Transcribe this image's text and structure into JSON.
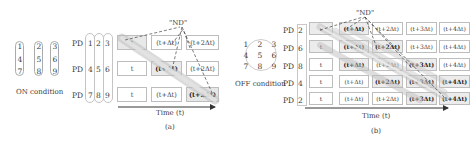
{
  "panel_a": {
    "caption": "(a)",
    "condition_label": "ON condition",
    "grid_numbers": [
      "1",
      "2",
      "3",
      "4",
      "5",
      "6",
      "7",
      "8",
      "9"
    ],
    "pd_label": "PD",
    "rows": [
      {
        "pd": "PD",
        "pixels": [
          "1",
          "2",
          "3"
        ],
        "cells": [
          "t",
          "(t+Δt)",
          "(t+2Δt)"
        ]
      },
      {
        "pd": "PD",
        "pixels": [
          "4",
          "5",
          "6"
        ],
        "cells": [
          "t",
          "(t+Δt)",
          "(t+2Δt)"
        ]
      },
      {
        "pd": "PD",
        "pixels": [
          "7",
          "8",
          "9"
        ],
        "cells": [
          "t",
          "(t+Δt)",
          "(t+2Δt)"
        ]
      }
    ],
    "nd_label": "\"ND\"",
    "axis_label": "Time (t)"
  },
  "panel_b": {
    "caption": "(b)",
    "condition_label": "OFF condition",
    "grid_numbers": [
      "1",
      "2",
      "3",
      "4",
      "5",
      "6",
      "7",
      "8",
      "9"
    ],
    "rows": [
      {
        "pd": "PD",
        "pixel": "2",
        "cells": [
          "t",
          "(t+Δt)",
          "(t+2Δt)",
          "(t+3Δt)",
          "(t+4Δt)"
        ]
      },
      {
        "pd": "PD",
        "pixel": "6",
        "cells": [
          "t",
          "(t+Δt)",
          "(t+2Δt)",
          "(t+3Δt)",
          "(t+4Δt)"
        ]
      },
      {
        "pd": "PD",
        "pixel": "8",
        "cells": [
          "t",
          "(t+Δt)",
          "(t+2Δt)",
          "(t+3Δt)",
          "(t+4Δt)"
        ]
      },
      {
        "pd": "PD",
        "pixel": "4",
        "cells": [
          "t",
          "(t+Δt)",
          "(t+2Δt)",
          "(t+3Δt)",
          "(t+4Δt)"
        ]
      },
      {
        "pd": "PD",
        "pixel": "2",
        "cells": [
          "t",
          "(t+Δt)",
          "(t+2Δt)",
          "(t+3Δt)",
          "(t+4Δt)"
        ]
      }
    ],
    "nd_label": "\"ND\"",
    "axis_label": "Time (t)"
  }
}
